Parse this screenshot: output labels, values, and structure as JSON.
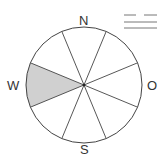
{
  "diagram": {
    "type": "wind-rose",
    "directions": {
      "north": "N",
      "south": "S",
      "west": "W",
      "east": "O"
    },
    "sectors": 8,
    "shaded_sector": "W",
    "colors": {
      "outline": "#444444",
      "shade": "#d0d0d0",
      "background": "#ffffff"
    },
    "legend_symbol": "wind-symbol"
  }
}
